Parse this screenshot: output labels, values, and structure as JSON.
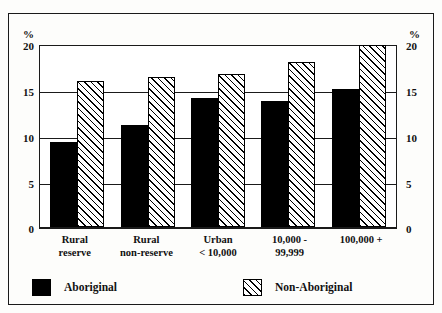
{
  "chart_data": {
    "type": "bar",
    "title": "",
    "subtitle": "",
    "xlabel": "",
    "ylabel": "%",
    "unit_label_left": "%",
    "unit_label_right": "%",
    "ylim": [
      0,
      20
    ],
    "yticks": [
      0,
      5,
      10,
      15,
      20
    ],
    "ytick_labels": [
      "0",
      "5",
      "10",
      "15",
      "20"
    ],
    "grid": true,
    "grid_axis": "y",
    "legend_position": "bottom",
    "categories": [
      "Rural reserve",
      "Rural non-reserve",
      "Urban < 10,000",
      "10,000 - 99,999",
      "100,000 +"
    ],
    "category_lines": [
      [
        "Rural",
        "reserve"
      ],
      [
        "Rural",
        "non-reserve"
      ],
      [
        "Urban",
        "< 10,000"
      ],
      [
        "10,000 -",
        "99,999"
      ],
      [
        "100,000 +",
        ""
      ]
    ],
    "series": [
      {
        "name": "Aboriginal",
        "fill": "solid-black",
        "color": "#000000",
        "values": [
          9.2,
          11.1,
          14.0,
          13.7,
          15.0
        ]
      },
      {
        "name": "Non-Aboriginal",
        "fill": "diagonal-hatch",
        "color": "#000000",
        "values": [
          15.9,
          16.3,
          16.6,
          17.9,
          19.8
        ]
      }
    ]
  },
  "legend": {
    "items": [
      {
        "label": "Aboriginal",
        "swatch": "solid-black"
      },
      {
        "label": "Non-Aboriginal",
        "swatch": "diagonal-hatch"
      }
    ]
  },
  "axis": {
    "unit": "%"
  }
}
